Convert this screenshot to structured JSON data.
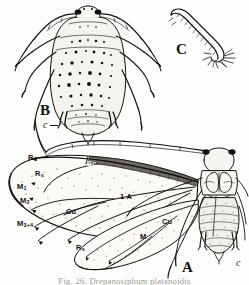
{
  "plate": {
    "title": "Aphid morphology plate",
    "caption": "Fig. 26. Drepanosiphum platanoidis",
    "background_color": "#fdfdfb",
    "ink_color": "#14110e"
  },
  "figures": [
    {
      "id": "A",
      "label": "A",
      "name": "winged-adult-aphid",
      "description": "Alate (winged) adult aphid, dorsal view with fore- and hind-wing venation"
    },
    {
      "id": "B",
      "label": "B",
      "name": "apterous-adult-aphid",
      "description": "Apterous (wingless) adult aphid, dorsal view"
    },
    {
      "id": "C",
      "label": "C",
      "name": "cornicle-detail",
      "description": "Detail of cornicle (siphunculus)"
    }
  ],
  "forewing_veins": [
    {
      "key": "R1",
      "text": "R",
      "sub": "1"
    },
    {
      "key": "Rs",
      "text": "R",
      "sub": "s"
    },
    {
      "key": "M1",
      "text": "M",
      "sub": "1"
    },
    {
      "key": "M2",
      "text": "M",
      "sub": "2"
    },
    {
      "key": "M34",
      "text": "M",
      "sub": "3+4"
    },
    {
      "key": "Cu",
      "text": "Cu",
      "sub": ""
    },
    {
      "key": "Sc",
      "text": "Sc",
      "sub": ""
    },
    {
      "key": "1A",
      "text": "1 A",
      "sub": ""
    }
  ],
  "hindwing_veins": [
    {
      "key": "Rs_h",
      "text": "R",
      "sub": "s"
    },
    {
      "key": "M_h",
      "text": "M",
      "sub": ""
    },
    {
      "key": "Cu_h",
      "text": "Cu",
      "sub": ""
    }
  ],
  "part_labels": [
    {
      "key": "cornicle_B",
      "text": "c",
      "note": "cornicle on figure B"
    },
    {
      "key": "cornicle_A",
      "text": "c",
      "note": "cornicle on figure A"
    }
  ],
  "colors": {
    "ink": "#14110e",
    "wing_membrane": "#fbfaf7",
    "pterostigma": "#6f6c64",
    "body_fill": "#f3f1ec",
    "caption_gray": "#9a9a92"
  }
}
